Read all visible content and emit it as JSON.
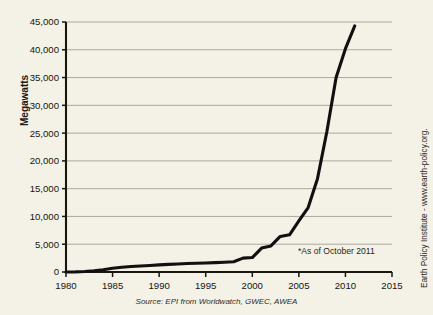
{
  "chart_data": {
    "type": "line",
    "title": "",
    "xlabel": "",
    "ylabel": "Megawatts",
    "xlim": [
      1980,
      2015
    ],
    "ylim": [
      0,
      45000
    ],
    "grid": true,
    "legend": "none",
    "x_ticks": [
      "1980",
      "1985",
      "1990",
      "1995",
      "2000",
      "2005",
      "2010",
      "2015"
    ],
    "x_tick_values": [
      1980,
      1985,
      1990,
      1995,
      2000,
      2005,
      2010,
      2015
    ],
    "y_ticks": [
      "0",
      "5,000",
      "10,000",
      "15,000",
      "20,000",
      "25,000",
      "30,000",
      "35,000",
      "40,000",
      "45,000"
    ],
    "y_tick_values": [
      0,
      5000,
      10000,
      15000,
      20000,
      25000,
      30000,
      35000,
      40000,
      45000
    ],
    "series": [
      {
        "name": "Wind power capacity",
        "x": [
          1980,
          1981,
          1982,
          1983,
          1984,
          1985,
          1986,
          1987,
          1988,
          1989,
          1990,
          1991,
          1992,
          1993,
          1994,
          1995,
          1996,
          1997,
          1998,
          1999,
          2000,
          2001,
          2002,
          2003,
          2004,
          2005,
          2006,
          2007,
          2008,
          2009,
          2010,
          2011
        ],
        "values": [
          10,
          25,
          90,
          220,
          420,
          670,
          850,
          980,
          1080,
          1180,
          1280,
          1380,
          1450,
          1520,
          1580,
          1620,
          1680,
          1750,
          1850,
          2500,
          2600,
          4300,
          4700,
          6400,
          6700,
          9200,
          11600,
          16800,
          25200,
          35000,
          40200,
          44300
        ]
      }
    ],
    "annotations": [
      {
        "name": "as-of-note",
        "text": "*As of October 2011"
      }
    ],
    "source": "Source: EPI from Worldwatch, GWEC, AWEA",
    "credit": "Earth Policy Institute - www.earth-policy.org."
  },
  "figure": {
    "top_caption": "",
    "background_color": "#f4f2e6",
    "line_color": "#101010",
    "grid_color": "#8b8a80",
    "axis_color": "#17170f"
  }
}
